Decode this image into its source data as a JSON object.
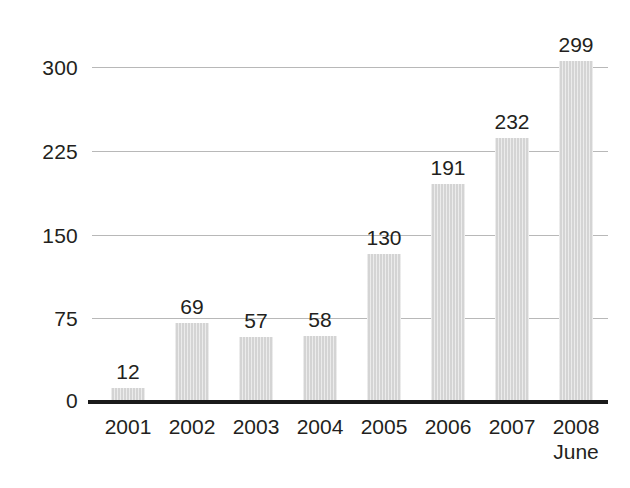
{
  "chart_data": {
    "type": "bar",
    "title": "",
    "subtitle": "",
    "xlabel": "",
    "ylabel": "",
    "categories": [
      "2001",
      "2002",
      "2003",
      "2004",
      "2005",
      "2006",
      "2007",
      "2008"
    ],
    "category_sublabels": [
      "",
      "",
      "",
      "",
      "",
      "",
      "",
      "June"
    ],
    "values": [
      12,
      69,
      57,
      58,
      130,
      191,
      232,
      299
    ],
    "value_labels": [
      "12",
      "69",
      "57",
      "58",
      "130",
      "191",
      "232",
      "299"
    ],
    "ylim": [
      0,
      300
    ],
    "yticks": [
      300,
      225,
      150,
      75,
      0
    ],
    "ytick_labels": [
      "300",
      "225",
      "150",
      "75",
      "0"
    ],
    "grid": true,
    "grid_axis": "y",
    "legend": false,
    "legend_position": "none",
    "colors": {
      "bar_fill": "#d4d4d4",
      "gridline": "#b8b8b8",
      "axis_line": "#1a1a1a",
      "text": "#231f20",
      "background": "#ffffff"
    }
  }
}
